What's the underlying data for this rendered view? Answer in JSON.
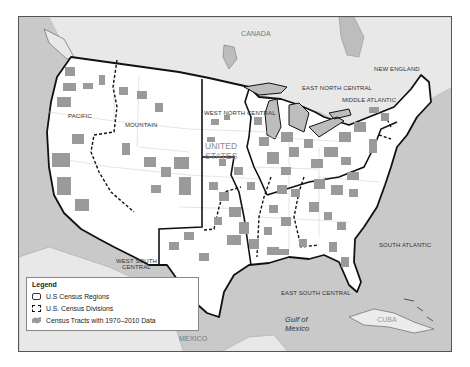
{
  "map": {
    "colors": {
      "water": "#c9c9c9",
      "foreign_land": "#e8e8e8",
      "us_land": "#ffffff",
      "tract": "#9a9a9a",
      "region_border": "#111111",
      "division_border": "#111111",
      "state_border": "#d0d0d0"
    },
    "country_labels": {
      "canada": "CANADA",
      "mexico": "MEXICO",
      "cuba": "CUBA",
      "united_states_line1": "UNITED",
      "united_states_line2": "STATES"
    },
    "water_labels": {
      "gulf_line1": "Gulf of",
      "gulf_line2": "Mexico"
    },
    "division_labels": {
      "pacific": "PACIFIC",
      "mountain": "MOUNTAIN",
      "west_north_central": "WEST NORTH CENTRAL",
      "east_north_central": "EAST NORTH CENTRAL",
      "middle_atlantic": "MIDDLE ATLANTIC",
      "new_england": "NEW ENGLAND",
      "west_south_central_line1": "WEST SOUTH",
      "west_south_central_line2": "CENTRAL",
      "east_south_central": "EAST SOUTH CENTRAL",
      "south_atlantic": "SOUTH ATLANTIC"
    }
  },
  "legend": {
    "title": "Legend",
    "items": [
      {
        "label": "U.S Census Regions",
        "symbol": "solid-outline"
      },
      {
        "label": "U.S. Census Divisions",
        "symbol": "dashed-outline"
      },
      {
        "label": "Census Tracts with 1970–2010 Data",
        "symbol": "gray-patch"
      }
    ]
  }
}
